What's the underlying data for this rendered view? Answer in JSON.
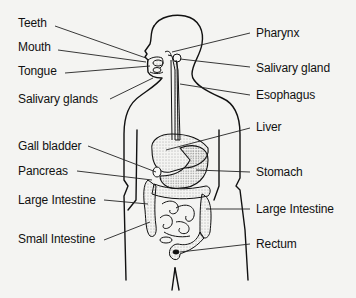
{
  "diagram": {
    "labels_left": [
      {
        "id": "teeth",
        "text": "Teeth",
        "x": 18,
        "y": 16
      },
      {
        "id": "mouth",
        "text": "Mouth",
        "x": 18,
        "y": 40
      },
      {
        "id": "tongue",
        "text": "Tongue",
        "x": 18,
        "y": 64
      },
      {
        "id": "salivary-glands",
        "text": "Salivary glands",
        "x": 18,
        "y": 90
      },
      {
        "id": "gall-bladder",
        "text": "Gall bladder",
        "x": 18,
        "y": 138
      },
      {
        "id": "pancreas",
        "text": "Pancreas",
        "x": 18,
        "y": 164
      },
      {
        "id": "large-intestine-left",
        "text": "Large Intestine",
        "x": 18,
        "y": 192
      },
      {
        "id": "small-intestine",
        "text": "Small Intestine",
        "x": 18,
        "y": 232
      }
    ],
    "labels_right": [
      {
        "id": "pharynx",
        "text": "Pharynx",
        "x": 256,
        "y": 26
      },
      {
        "id": "salivary-gland",
        "text": "Salivary gland",
        "x": 256,
        "y": 61
      },
      {
        "id": "esophagus",
        "text": "Esophagus",
        "x": 256,
        "y": 88
      },
      {
        "id": "liver",
        "text": "Liver",
        "x": 256,
        "y": 119
      },
      {
        "id": "stomach",
        "text": "Stomach",
        "x": 256,
        "y": 170
      },
      {
        "id": "large-intestine-right",
        "text": "Large Intestine",
        "x": 256,
        "y": 206
      },
      {
        "id": "rectum",
        "text": "Rectum",
        "x": 256,
        "y": 240
      }
    ],
    "colors": {
      "background": "#f4f4f2",
      "line": "#111111",
      "stipple": "#555555"
    }
  }
}
